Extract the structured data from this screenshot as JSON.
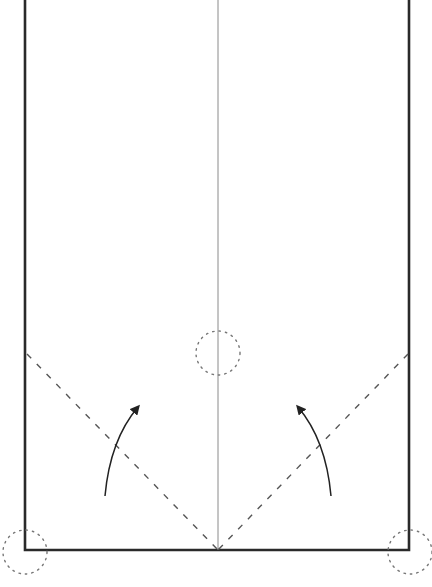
{
  "diagram": {
    "colors": {
      "background": "#ffffff",
      "paper_edge": "#2a2a2a",
      "center_crease": "#8a8a8a",
      "valley_fold": "#555555",
      "arrow": "#222222",
      "reference_circle": "#777777"
    },
    "paper": {
      "left_x": 25,
      "right_x": 409,
      "top_y": 0,
      "bottom_y": 550
    },
    "center_crease": {
      "x": 218,
      "y1": 0,
      "y2": 550
    },
    "valley_folds": [
      {
        "name": "left-corner-fold",
        "x1": 27,
        "y1": 354,
        "x2": 218,
        "y2": 550
      },
      {
        "name": "right-corner-fold",
        "x1": 408,
        "y1": 354,
        "x2": 218,
        "y2": 550
      }
    ],
    "arrows": [
      {
        "name": "left-fold-arrow",
        "start": [
          105,
          496
        ],
        "control": [
          110,
          440
        ],
        "end": [
          138,
          407
        ]
      },
      {
        "name": "right-fold-arrow",
        "start": [
          331,
          496
        ],
        "control": [
          326,
          440
        ],
        "end": [
          298,
          407
        ]
      }
    ],
    "reference_circles": [
      {
        "name": "center-target-circle",
        "cx": 218,
        "cy": 353,
        "r": 22
      },
      {
        "name": "bottom-left-corner-circle",
        "cx": 25,
        "cy": 552,
        "r": 22
      },
      {
        "name": "bottom-right-corner-circle",
        "cx": 410,
        "cy": 552,
        "r": 22
      }
    ]
  }
}
